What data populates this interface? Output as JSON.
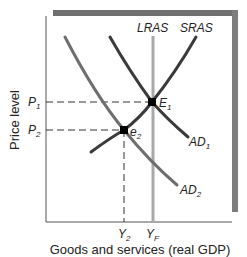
{
  "diagram": {
    "type": "AD-AS model",
    "y_axis_label": "Price level",
    "x_axis_label": "Goods and services (real GDP)",
    "curves": {
      "lras": {
        "label": "LRAS",
        "color": "#a8a8a8"
      },
      "sras": {
        "label": "SRAS",
        "color": "#3a3a3a"
      },
      "ad1": {
        "label": "AD",
        "sub": "1",
        "color": "#3a3a3a"
      },
      "ad2": {
        "label": "AD",
        "sub": "2",
        "color": "#6e6e6e"
      }
    },
    "points": {
      "e1": {
        "label": "E",
        "sub": "1"
      },
      "e2": {
        "label": "e",
        "sub": "2"
      }
    },
    "y_ticks": [
      {
        "label": "P",
        "sub": "1"
      },
      {
        "label": "P",
        "sub": "2"
      }
    ],
    "x_ticks": [
      {
        "label": "Y",
        "sub": "2"
      },
      {
        "label": "Y",
        "sub": "F"
      }
    ],
    "frame": {
      "shadow_color": "#6f6f6f",
      "shadow_right_color": "#8a8a8a"
    }
  }
}
